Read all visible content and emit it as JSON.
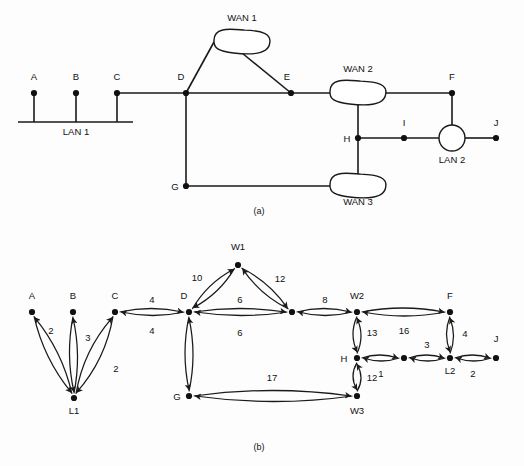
{
  "figure": {
    "title_text": "Network topology and its weighted graph representation",
    "background_color": "#fdfdfd",
    "ink_color": "#111111",
    "width": 524,
    "height": 466
  },
  "panel_a": {
    "caption": "(a)",
    "caption_pos": {
      "x": 259,
      "y": 214
    },
    "description": "Physical network topology with LANs, hosts and WANs",
    "hosts": [
      {
        "id": "A",
        "label": "A",
        "x": 34,
        "y": 93,
        "label_x": 34,
        "label_y": 80,
        "stem_to_y": 122
      },
      {
        "id": "B",
        "label": "B",
        "x": 76,
        "y": 93,
        "label_x": 76,
        "label_y": 80,
        "stem_to_y": 122
      },
      {
        "id": "C",
        "label": "C",
        "x": 117,
        "y": 93,
        "label_x": 117,
        "label_y": 80,
        "stem_to_y": 122
      },
      {
        "id": "D",
        "label": "D",
        "x": 186,
        "y": 93,
        "label_x": 181,
        "label_y": 80,
        "stem_to_y": null
      },
      {
        "id": "E",
        "label": "E",
        "x": 291,
        "y": 93,
        "label_x": 287,
        "label_y": 80,
        "stem_to_y": null
      },
      {
        "id": "F",
        "label": "F",
        "x": 452,
        "y": 93,
        "label_x": 452,
        "label_y": 80,
        "stem_to_y": null
      },
      {
        "id": "G",
        "label": "G",
        "x": 186,
        "y": 186,
        "label_x": 175,
        "label_y": 190,
        "stem_to_y": null
      },
      {
        "id": "H",
        "label": "H",
        "x": 358,
        "y": 138,
        "label_x": 347,
        "label_y": 142,
        "stem_to_y": null
      },
      {
        "id": "I",
        "label": "I",
        "x": 404,
        "y": 138,
        "label_x": 404,
        "label_y": 126,
        "stem_to_y": null
      },
      {
        "id": "J",
        "label": "J",
        "x": 496,
        "y": 138,
        "label_x": 496,
        "label_y": 126,
        "stem_to_y": null
      }
    ],
    "lan1": {
      "label": "LAN 1",
      "label_x": 76,
      "label_y": 135,
      "bus_y": 122,
      "bus_x1": 18,
      "bus_x2": 133
    },
    "lan2": {
      "label": "LAN 2",
      "label_x": 452,
      "label_y": 163,
      "cx": 452,
      "cy": 138,
      "r": 13
    },
    "wans": [
      {
        "id": "WAN1",
        "label": "WAN 1",
        "cx": 242,
        "cy": 42,
        "rx": 28,
        "ry": 11,
        "label_x": 242,
        "label_y": 21
      },
      {
        "id": "WAN2",
        "label": "WAN 2",
        "cx": 358,
        "cy": 93,
        "rx": 28,
        "ry": 11,
        "label_x": 358,
        "label_y": 72
      },
      {
        "id": "WAN3",
        "label": "WAN 3",
        "cx": 358,
        "cy": 186,
        "rx": 28,
        "ry": 11,
        "label_x": 358,
        "label_y": 205
      }
    ],
    "links": [
      {
        "from": "C",
        "to": "D",
        "kind": "straight"
      },
      {
        "from": "D",
        "to": "E",
        "kind": "straight"
      },
      {
        "from": "E",
        "to": "WAN2",
        "kind": "straight"
      },
      {
        "from": "D",
        "to": "WAN1",
        "kind": "straight"
      },
      {
        "from": "WAN1",
        "to": "E",
        "kind": "straight"
      },
      {
        "from": "WAN2",
        "to": "F",
        "kind": "straight"
      },
      {
        "from": "F",
        "to": "LAN2",
        "kind": "straight"
      },
      {
        "from": "WAN2",
        "to": "H",
        "kind": "straight"
      },
      {
        "from": "H",
        "to": "I",
        "kind": "straight"
      },
      {
        "from": "I",
        "to": "LAN2",
        "kind": "straight"
      },
      {
        "from": "LAN2",
        "to": "J",
        "kind": "straight"
      },
      {
        "from": "H",
        "to": "WAN3",
        "kind": "straight"
      },
      {
        "from": "D",
        "to": "G",
        "kind": "straight"
      },
      {
        "from": "G",
        "to": "WAN3",
        "kind": "straight"
      }
    ]
  },
  "panel_b": {
    "caption": "(b)",
    "caption_pos": {
      "x": 259,
      "y": 450
    },
    "description": "Directed weighted graph of the network with link costs",
    "nodes": [
      {
        "id": "A",
        "label": "A",
        "x": 32,
        "y": 312,
        "label_x": 32,
        "label_y": 299,
        "label_anchor": "middle"
      },
      {
        "id": "B",
        "label": "B",
        "x": 73,
        "y": 312,
        "label_x": 73,
        "label_y": 299,
        "label_anchor": "middle"
      },
      {
        "id": "C",
        "label": "C",
        "x": 115,
        "y": 312,
        "label_x": 115,
        "label_y": 299,
        "label_anchor": "middle"
      },
      {
        "id": "L1",
        "label": "L1",
        "x": 74,
        "y": 398,
        "label_x": 74,
        "label_y": 414,
        "label_anchor": "middle"
      },
      {
        "id": "D",
        "label": "D",
        "x": 189,
        "y": 312,
        "label_x": 184,
        "label_y": 299,
        "label_anchor": "middle"
      },
      {
        "id": "W1",
        "label": "W1",
        "x": 238,
        "y": 265,
        "label_x": 238,
        "label_y": 250,
        "label_anchor": "middle"
      },
      {
        "id": "E",
        "label": "",
        "x": 292,
        "y": 312,
        "label_x": 292,
        "label_y": 299,
        "label_anchor": "middle"
      },
      {
        "id": "W2",
        "label": "W2",
        "x": 357,
        "y": 312,
        "label_x": 357,
        "label_y": 299,
        "label_anchor": "middle"
      },
      {
        "id": "F",
        "label": "F",
        "x": 450,
        "y": 312,
        "label_x": 450,
        "label_y": 299,
        "label_anchor": "middle"
      },
      {
        "id": "H",
        "label": "H",
        "x": 357,
        "y": 358,
        "label_x": 344,
        "label_y": 362,
        "label_anchor": "middle"
      },
      {
        "id": "I",
        "label": "",
        "x": 404,
        "y": 358,
        "label_x": 404,
        "label_y": 346,
        "label_anchor": "middle"
      },
      {
        "id": "L2",
        "label": "L2",
        "x": 450,
        "y": 358,
        "label_x": 450,
        "label_y": 374,
        "label_anchor": "middle"
      },
      {
        "id": "J",
        "label": "J",
        "x": 496,
        "y": 358,
        "label_x": 496,
        "label_y": 342,
        "label_anchor": "middle"
      },
      {
        "id": "G",
        "label": "G",
        "x": 189,
        "y": 396,
        "label_x": 177,
        "label_y": 400,
        "label_anchor": "middle"
      },
      {
        "id": "W3",
        "label": "W3",
        "x": 357,
        "y": 396,
        "label_x": 357,
        "label_y": 414,
        "label_anchor": "middle"
      }
    ],
    "edges": [
      {
        "from": "L1",
        "to": "A",
        "weight": "",
        "bow": 10,
        "wx": 0,
        "wy": 0
      },
      {
        "from": "A",
        "to": "L1",
        "weight": "2",
        "bow": 10,
        "wx": 51,
        "wy": 334
      },
      {
        "from": "L1",
        "to": "B",
        "weight": "",
        "bow": 8,
        "wx": 0,
        "wy": 0
      },
      {
        "from": "B",
        "to": "L1",
        "weight": "3",
        "bow": 8,
        "wx": 88,
        "wy": 341
      },
      {
        "from": "L1",
        "to": "C",
        "weight": "",
        "bow": -12,
        "wx": 0,
        "wy": 0
      },
      {
        "from": "C",
        "to": "L1",
        "weight": "2",
        "bow": -12,
        "wx": 116,
        "wy": 372
      },
      {
        "from": "C",
        "to": "D",
        "weight": "4",
        "bow": -7,
        "wx": 152,
        "wy": 303
      },
      {
        "from": "D",
        "to": "C",
        "weight": "4",
        "bow": -7,
        "wx": 152,
        "wy": 334
      },
      {
        "from": "D",
        "to": "W1",
        "weight": "10",
        "bow": -8,
        "wx": 197,
        "wy": 281
      },
      {
        "from": "W1",
        "to": "D",
        "weight": "",
        "bow": -8,
        "wx": 0,
        "wy": 0
      },
      {
        "from": "W1",
        "to": "E",
        "weight": "12",
        "bow": -8,
        "wx": 280,
        "wy": 282
      },
      {
        "from": "E",
        "to": "W1",
        "weight": "",
        "bow": -8,
        "wx": 0,
        "wy": 0
      },
      {
        "from": "D",
        "to": "E",
        "weight": "6",
        "bow": -7,
        "wx": 240,
        "wy": 303
      },
      {
        "from": "E",
        "to": "D",
        "weight": "6",
        "bow": -7,
        "wx": 240,
        "wy": 336
      },
      {
        "from": "E",
        "to": "W2",
        "weight": "8",
        "bow": -7,
        "wx": 325,
        "wy": 303
      },
      {
        "from": "W2",
        "to": "E",
        "weight": "",
        "bow": -7,
        "wx": 0,
        "wy": 0
      },
      {
        "from": "W2",
        "to": "F",
        "weight": "",
        "bow": -8,
        "wx": 0,
        "wy": 0
      },
      {
        "from": "F",
        "to": "W2",
        "weight": "16",
        "bow": -8,
        "wx": 404,
        "wy": 334
      },
      {
        "from": "W2",
        "to": "H",
        "weight": "",
        "bow": 8,
        "wx": 0,
        "wy": 0
      },
      {
        "from": "H",
        "to": "W2",
        "weight": "13",
        "bow": 8,
        "wx": 372,
        "wy": 336
      },
      {
        "from": "H",
        "to": "I",
        "weight": "",
        "bow": -6,
        "wx": 0,
        "wy": 0
      },
      {
        "from": "I",
        "to": "H",
        "weight": "1",
        "bow": -6,
        "wx": 381,
        "wy": 377
      },
      {
        "from": "I",
        "to": "L2",
        "weight": "3",
        "bow": -6,
        "wx": 427,
        "wy": 348
      },
      {
        "from": "L2",
        "to": "I",
        "weight": "",
        "bow": -6,
        "wx": 0,
        "wy": 0
      },
      {
        "from": "L2",
        "to": "J",
        "weight": "",
        "bow": -6,
        "wx": 0,
        "wy": 0
      },
      {
        "from": "J",
        "to": "L2",
        "weight": "2",
        "bow": -6,
        "wx": 473,
        "wy": 377
      },
      {
        "from": "F",
        "to": "L2",
        "weight": "4",
        "bow": 7,
        "wx": 465,
        "wy": 337
      },
      {
        "from": "L2",
        "to": "F",
        "weight": "",
        "bow": 7,
        "wx": 0,
        "wy": 0
      },
      {
        "from": "D",
        "to": "G",
        "weight": "",
        "bow": 8,
        "wx": 0,
        "wy": 0
      },
      {
        "from": "G",
        "to": "D",
        "weight": "",
        "bow": 8,
        "wx": 0,
        "wy": 0
      },
      {
        "from": "G",
        "to": "W3",
        "weight": "17",
        "bow": -11,
        "wx": 272,
        "wy": 381
      },
      {
        "from": "W3",
        "to": "G",
        "weight": "",
        "bow": -11,
        "wx": 0,
        "wy": 0
      },
      {
        "from": "H",
        "to": "W3",
        "weight": "",
        "bow": 8,
        "wx": 0,
        "wy": 0
      },
      {
        "from": "W3",
        "to": "H",
        "weight": "12",
        "bow": 8,
        "wx": 372,
        "wy": 381
      }
    ]
  },
  "graph_data": {
    "type": "diagram",
    "weighted_edges": [
      {
        "pair": "A-L1",
        "weight": 2
      },
      {
        "pair": "B-L1",
        "weight": 3
      },
      {
        "pair": "C-L1",
        "weight": 2
      },
      {
        "pair": "C-D",
        "weight": 4
      },
      {
        "pair": "D-W1",
        "weight": 10
      },
      {
        "pair": "W1-E",
        "weight": 12
      },
      {
        "pair": "D-E",
        "weight": 6
      },
      {
        "pair": "E-W2",
        "weight": 8
      },
      {
        "pair": "W2-F",
        "weight": 16
      },
      {
        "pair": "W2-H",
        "weight": 13
      },
      {
        "pair": "H-I",
        "weight": 1
      },
      {
        "pair": "I-L2",
        "weight": 3
      },
      {
        "pair": "L2-J",
        "weight": 2
      },
      {
        "pair": "F-L2",
        "weight": 4
      },
      {
        "pair": "G-W3",
        "weight": 17
      },
      {
        "pair": "H-W3",
        "weight": 12
      }
    ]
  }
}
